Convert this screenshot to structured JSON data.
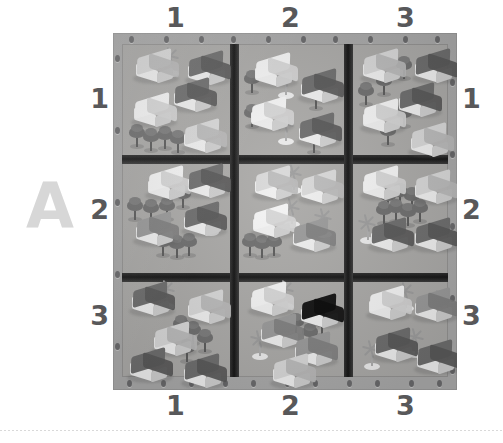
{
  "page": {
    "plate_letter": "A",
    "background_color": "#ffffff",
    "board_color": "#a9a9a9",
    "divider_color": "#242424",
    "label_color": "#58585a",
    "plate_letter_color": "#d7d7d7"
  },
  "axes": {
    "top_labels": [
      "1",
      "2",
      "3"
    ],
    "bottom_labels": [
      "1",
      "2",
      "3"
    ],
    "left_labels": [
      "1",
      "2",
      "3"
    ],
    "right_labels": [
      "1",
      "2",
      "3"
    ]
  },
  "board": {
    "rows": 3,
    "columns": 3,
    "peg_holes_top": 10,
    "peg_holes_bottom": 11,
    "peg_holes_left": 5,
    "peg_holes_right": 5,
    "cells": [
      {
        "id": "A1-1",
        "row_label": "1",
        "column_label": "1",
        "houses": [
          {
            "roof": "light",
            "x": 10,
            "y": 8
          },
          {
            "roof": "dark",
            "x": 62,
            "y": 10
          },
          {
            "roof": "dark",
            "x": 48,
            "y": 37
          },
          {
            "roof": "white",
            "x": 8,
            "y": 52
          },
          {
            "roof": "light",
            "x": 58,
            "y": 78
          }
        ],
        "trees": [
          {
            "x": 6,
            "y": 82
          },
          {
            "x": 20,
            "y": 86
          },
          {
            "x": 34,
            "y": 84
          },
          {
            "x": 47,
            "y": 88
          }
        ],
        "palms": [
          {
            "x": 38,
            "y": 6
          }
        ]
      },
      {
        "id": "A1-2",
        "row_label": "1",
        "column_label": "2",
        "houses": [
          {
            "roof": "white",
            "x": 12,
            "y": 12
          },
          {
            "roof": "dark",
            "x": 58,
            "y": 28
          },
          {
            "roof": "white",
            "x": 8,
            "y": 56
          },
          {
            "roof": "dark",
            "x": 56,
            "y": 72
          }
        ],
        "trees": [
          {
            "x": 4,
            "y": 28
          },
          {
            "x": 4,
            "y": 62
          },
          {
            "x": 68,
            "y": 44
          },
          {
            "x": 66,
            "y": 88
          }
        ],
        "palms": [
          {
            "x": 36,
            "y": 28
          },
          {
            "x": 36,
            "y": 74
          }
        ]
      },
      {
        "id": "A1-3",
        "row_label": "1",
        "column_label": "3",
        "houses": [
          {
            "roof": "light",
            "x": 6,
            "y": 8
          },
          {
            "roof": "dark",
            "x": 58,
            "y": 8
          },
          {
            "roof": "dark",
            "x": 42,
            "y": 42
          },
          {
            "roof": "white",
            "x": 6,
            "y": 58
          },
          {
            "roof": "light",
            "x": 54,
            "y": 82
          }
        ],
        "trees": [
          {
            "x": 42,
            "y": 14
          },
          {
            "x": 22,
            "y": 30
          },
          {
            "x": 4,
            "y": 40
          },
          {
            "x": 42,
            "y": 62
          },
          {
            "x": 26,
            "y": 80
          }
        ],
        "palms": []
      },
      {
        "id": "A2-1",
        "row_label": "2",
        "column_label": "1",
        "houses": [
          {
            "roof": "white",
            "x": 22,
            "y": 6
          },
          {
            "roof": "dark",
            "x": 62,
            "y": 4
          },
          {
            "roof": "dark",
            "x": 58,
            "y": 42
          },
          {
            "roof": "mid",
            "x": 10,
            "y": 52
          }
        ],
        "trees": [
          {
            "x": 4,
            "y": 36
          },
          {
            "x": 20,
            "y": 38
          },
          {
            "x": 36,
            "y": 36
          },
          {
            "x": 52,
            "y": 24
          },
          {
            "x": 32,
            "y": 72
          },
          {
            "x": 46,
            "y": 74
          },
          {
            "x": 58,
            "y": 72
          }
        ],
        "palms": [
          {
            "x": 78,
            "y": 46
          }
        ]
      },
      {
        "id": "A2-2",
        "row_label": "2",
        "column_label": "2",
        "houses": [
          {
            "roof": "light",
            "x": 12,
            "y": 6
          },
          {
            "roof": "light",
            "x": 58,
            "y": 10
          },
          {
            "roof": "white",
            "x": 10,
            "y": 44
          },
          {
            "roof": "mid",
            "x": 50,
            "y": 58
          }
        ],
        "trees": [
          {
            "x": 2,
            "y": 72
          },
          {
            "x": 14,
            "y": 74
          },
          {
            "x": 26,
            "y": 72
          }
        ],
        "palms": [
          {
            "x": 44,
            "y": 4
          },
          {
            "x": 42,
            "y": 38
          },
          {
            "x": 74,
            "y": 48
          }
        ]
      },
      {
        "id": "A2-3",
        "row_label": "2",
        "column_label": "3",
        "houses": [
          {
            "roof": "white",
            "x": 6,
            "y": 6
          },
          {
            "roof": "light",
            "x": 58,
            "y": 10
          },
          {
            "roof": "dark",
            "x": 14,
            "y": 58
          },
          {
            "roof": "dark",
            "x": 58,
            "y": 58
          }
        ],
        "trees": [
          {
            "x": 26,
            "y": 26
          },
          {
            "x": 38,
            "y": 22
          },
          {
            "x": 50,
            "y": 26
          },
          {
            "x": 22,
            "y": 40
          },
          {
            "x": 34,
            "y": 38
          },
          {
            "x": 46,
            "y": 42
          },
          {
            "x": 58,
            "y": 38
          }
        ],
        "palms": [
          {
            "x": 4,
            "y": 54
          }
        ]
      },
      {
        "id": "A3-1",
        "row_label": "3",
        "column_label": "1",
        "houses": [
          {
            "roof": "dark",
            "x": 6,
            "y": 4
          },
          {
            "roof": "light",
            "x": 62,
            "y": 12
          },
          {
            "roof": "light",
            "x": 28,
            "y": 44
          },
          {
            "roof": "dark",
            "x": 4,
            "y": 70
          },
          {
            "roof": "dark",
            "x": 58,
            "y": 76
          }
        ],
        "trees": [
          {
            "x": 50,
            "y": 36
          },
          {
            "x": 62,
            "y": 42
          },
          {
            "x": 74,
            "y": 50
          },
          {
            "x": 56,
            "y": 60
          }
        ],
        "palms": [
          {
            "x": 34,
            "y": 2
          }
        ]
      },
      {
        "id": "A3-2",
        "row_label": "3",
        "column_label": "2",
        "houses": [
          {
            "roof": "white",
            "x": 8,
            "y": 4
          },
          {
            "roof": "black",
            "x": 58,
            "y": 16
          },
          {
            "roof": "mid",
            "x": 18,
            "y": 36
          },
          {
            "roof": "mid",
            "x": 52,
            "y": 54
          },
          {
            "roof": "light",
            "x": 30,
            "y": 76
          }
        ],
        "trees": [
          {
            "x": 48,
            "y": 34
          },
          {
            "x": 62,
            "y": 44
          },
          {
            "x": 74,
            "y": 34
          },
          {
            "x": 76,
            "y": 18
          }
        ],
        "palms": [
          {
            "x": 36,
            "y": 2
          },
          {
            "x": 10,
            "y": 52
          }
        ]
      },
      {
        "id": "A3-3",
        "row_label": "3",
        "column_label": "3",
        "houses": [
          {
            "roof": "white",
            "x": 12,
            "y": 8
          },
          {
            "roof": "mid",
            "x": 58,
            "y": 10
          },
          {
            "roof": "dark",
            "x": 18,
            "y": 50
          },
          {
            "roof": "dark",
            "x": 60,
            "y": 62
          }
        ],
        "trees": [],
        "palms": [
          {
            "x": 42,
            "y": 4
          },
          {
            "x": 76,
            "y": 12
          },
          {
            "x": 52,
            "y": 50
          },
          {
            "x": 8,
            "y": 62
          }
        ]
      }
    ]
  }
}
